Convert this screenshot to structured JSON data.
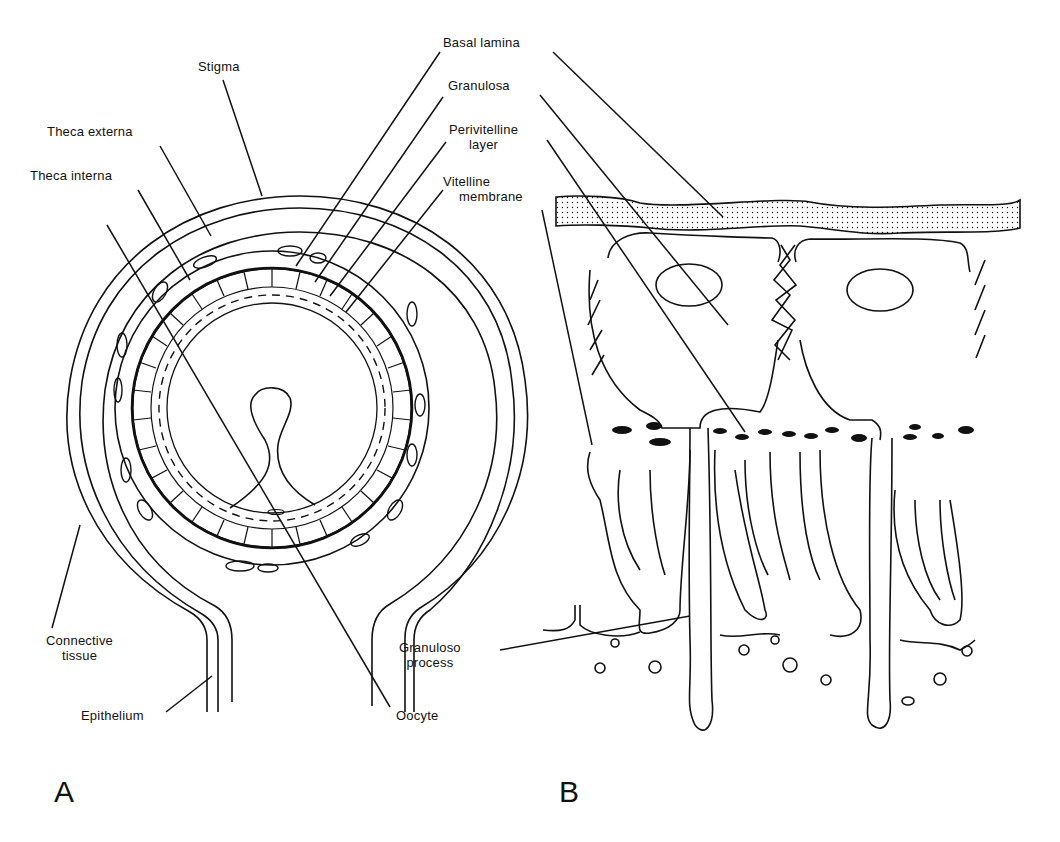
{
  "figure": {
    "panels": [
      {
        "id": "A",
        "letter": "A"
      },
      {
        "id": "B",
        "letter": "B"
      }
    ],
    "labels": {
      "stigma": "Stigma",
      "theca_externa": "Theca externa",
      "theca_interna": "Theca interna",
      "basal_lamina": "Basal lamina",
      "granulosa": "Granulosa",
      "perivitelline_line1": "Perivitelline",
      "perivitelline_line2": "layer",
      "vitelline_line1": "Vitelline",
      "vitelline_line2": "membrane",
      "connective_line1": "Connective",
      "connective_line2": "tissue",
      "epithelium": "Epithelium",
      "oocyte": "Oocyte",
      "granuloso_line1": "Granuloso",
      "granuloso_line2": "process"
    },
    "colors": {
      "ink": "#111111",
      "background": "#ffffff"
    }
  }
}
